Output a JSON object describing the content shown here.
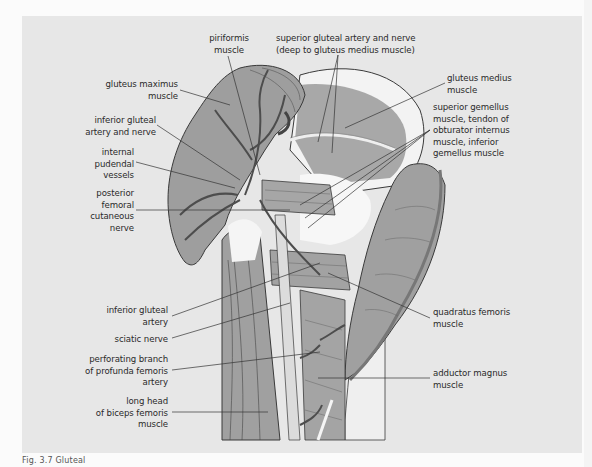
{
  "figure": {
    "caption_fragment": "Fig. 3.7  Gluteal",
    "colors": {
      "background": "#fbfbfb",
      "panel": "#e7e7e7",
      "muscle_fill": "#9e9e9e",
      "muscle_light": "#b4b4b4",
      "tendon_fill": "#f2f2f2",
      "outline": "#3a3a3a",
      "leader_line": "#333333",
      "label_text": "#2a2a2a"
    },
    "labels": {
      "piriformis": "piriformis\nmuscle",
      "superior_gluteal": "superior gluteal artery and nerve\n(deep to gluteus medius muscle)",
      "gluteus_maximus": "gluteus maximus\nmuscle",
      "gluteus_medius": "gluteus medius\nmuscle",
      "gemelli_obturator": "superior gemellus\nmuscle, tendon of\nobturator internus\nmuscle, inferior\ngemellus muscle",
      "inferior_gluteal_artery_nerve": "inferior gluteal\nartery and nerve",
      "internal_pudendal": "internal\npudendal\nvessels",
      "posterior_femoral_cutaneous": "posterior\nfemoral\ncutaneous\nnerve",
      "inferior_gluteal_artery": "inferior gluteal\nartery",
      "sciatic_nerve": "sciatic nerve",
      "perforating_branch": "perforating branch\nof profunda femoris\nartery",
      "long_head_biceps": "long head\nof biceps femoris\nmuscle",
      "quadratus_femoris": "quadratus femoris\nmuscle",
      "adductor_magnus": "adductor magnus\nmuscle"
    }
  }
}
